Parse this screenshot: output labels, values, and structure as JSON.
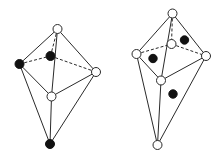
{
  "figures": [
    {
      "name": "left-polyhedron",
      "nodes": [
        {
          "id": "top",
          "x": 57.5,
          "y": 29,
          "fill": "white"
        },
        {
          "id": "back",
          "x": 50.5,
          "y": 56,
          "fill": "black"
        },
        {
          "id": "left",
          "x": 19.5,
          "y": 64,
          "fill": "black"
        },
        {
          "id": "right",
          "x": 96,
          "y": 72,
          "fill": "white"
        },
        {
          "id": "middle",
          "x": 51.5,
          "y": 96.5,
          "fill": "white"
        },
        {
          "id": "bottom",
          "x": 50,
          "y": 144,
          "fill": "black"
        }
      ],
      "edges": [
        {
          "from": "top",
          "to": "left",
          "style": "solid"
        },
        {
          "from": "top",
          "to": "right",
          "style": "solid"
        },
        {
          "from": "top",
          "to": "middle",
          "style": "solid"
        },
        {
          "from": "top",
          "to": "back",
          "style": "dashed"
        },
        {
          "from": "left",
          "to": "back",
          "style": "dashed"
        },
        {
          "from": "back",
          "to": "right",
          "style": "dashed"
        },
        {
          "from": "left",
          "to": "middle",
          "style": "solid"
        },
        {
          "from": "right",
          "to": "middle",
          "style": "solid"
        },
        {
          "from": "left",
          "to": "bottom",
          "style": "solid"
        },
        {
          "from": "right",
          "to": "bottom",
          "style": "solid"
        },
        {
          "from": "middle",
          "to": "bottom",
          "style": "solid"
        }
      ],
      "free_dots": []
    },
    {
      "name": "right-polyhedron",
      "nodes": [
        {
          "id": "top",
          "x": 172.5,
          "y": 13.5,
          "fill": "white"
        },
        {
          "id": "back",
          "x": 171.5,
          "y": 44,
          "fill": "white"
        },
        {
          "id": "left",
          "x": 136.5,
          "y": 54,
          "fill": "white"
        },
        {
          "id": "right",
          "x": 206,
          "y": 56,
          "fill": "white"
        },
        {
          "id": "middle",
          "x": 161,
          "y": 80.5,
          "fill": "white"
        },
        {
          "id": "bottom",
          "x": 157.5,
          "y": 145,
          "fill": "white"
        }
      ],
      "edges": [
        {
          "from": "top",
          "to": "left",
          "style": "solid"
        },
        {
          "from": "top",
          "to": "right",
          "style": "solid"
        },
        {
          "from": "top",
          "to": "middle",
          "style": "solid"
        },
        {
          "from": "top",
          "to": "back",
          "style": "dashed"
        },
        {
          "from": "left",
          "to": "back",
          "style": "dashed"
        },
        {
          "from": "back",
          "to": "right",
          "style": "dashed"
        },
        {
          "from": "left",
          "to": "middle",
          "style": "solid"
        },
        {
          "from": "right",
          "to": "middle",
          "style": "solid"
        },
        {
          "from": "left",
          "to": "bottom",
          "style": "solid"
        },
        {
          "from": "right",
          "to": "bottom",
          "style": "solid"
        },
        {
          "from": "middle",
          "to": "bottom",
          "style": "solid"
        }
      ],
      "free_dots": [
        {
          "x": 184.5,
          "y": 40
        },
        {
          "x": 153,
          "y": 58.5
        },
        {
          "x": 173,
          "y": 94
        }
      ]
    }
  ],
  "style": {
    "node_radius": 4.5,
    "dot_radius": 4.2,
    "stroke_color": "#2a2a2a",
    "black_fill": "#111111",
    "white_fill": "#ffffff"
  }
}
